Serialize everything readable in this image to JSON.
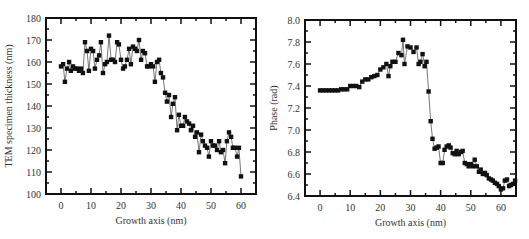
{
  "chart_data": [
    {
      "type": "line",
      "title": "",
      "xlabel": "Growth axis (nm)",
      "ylabel": "TEM specimen thickness (nm)",
      "xlim": [
        -5,
        65
      ],
      "ylim": [
        100,
        180
      ],
      "xticks": [
        0,
        10,
        20,
        30,
        40,
        50,
        60
      ],
      "yticks": [
        100,
        110,
        120,
        130,
        140,
        150,
        160,
        170,
        180
      ],
      "grid": false,
      "legend": null,
      "marker": "square",
      "series": [
        {
          "name": "thickness",
          "x": [
            0,
            0.7,
            1.3,
            2,
            2.7,
            3.3,
            4,
            4.7,
            5.3,
            6,
            6.7,
            7.3,
            8,
            8.7,
            9.3,
            10,
            10.7,
            11.3,
            12,
            12.7,
            13.3,
            14,
            14.7,
            15.3,
            16,
            16.7,
            17.3,
            18,
            18.7,
            19.3,
            20,
            20.7,
            21.3,
            22,
            22.7,
            23.3,
            24,
            24.7,
            25.3,
            26,
            26.7,
            27.3,
            28,
            28.7,
            29.3,
            30,
            30.7,
            31.3,
            32,
            32.7,
            33.3,
            34,
            34.7,
            35.3,
            36,
            36.7,
            37.3,
            38,
            38.7,
            39.3,
            40,
            40.7,
            41.3,
            42,
            42.7,
            43.3,
            44,
            44.7,
            45.3,
            46,
            46.7,
            47.3,
            48,
            48.7,
            49.3,
            50,
            50.7,
            51.3,
            52,
            52.7,
            53.3,
            54,
            54.7,
            55.3,
            56,
            56.7,
            57.3,
            58,
            58.7,
            59.3,
            60
          ],
          "values": [
            158,
            159,
            151,
            157,
            160,
            156,
            158,
            157,
            157,
            156,
            157,
            155,
            169,
            165,
            156,
            166,
            165,
            157,
            161,
            163,
            169,
            155,
            159,
            160,
            172,
            161,
            161,
            160,
            169,
            168,
            161,
            157,
            158,
            161,
            166,
            159,
            167,
            166,
            165,
            170,
            161,
            165,
            164,
            158,
            158,
            159,
            158,
            151,
            160,
            161,
            155,
            153,
            146,
            142,
            145,
            135,
            141,
            144,
            129,
            136,
            131,
            131,
            135,
            133,
            132,
            129,
            131,
            126,
            128,
            119,
            127,
            124,
            122,
            121,
            117,
            124,
            122,
            122,
            120,
            124,
            119,
            120,
            114,
            124,
            128,
            126,
            121,
            121,
            117,
            121,
            108,
            115,
            118,
            117,
            113,
            112
          ]
        }
      ]
    },
    {
      "type": "line",
      "title": "",
      "xlabel": "Growth axis (nm)",
      "ylabel": "Phase (rad)",
      "xlim": [
        -5,
        65
      ],
      "ylim": [
        6.4,
        8.0
      ],
      "xticks": [
        0,
        10,
        20,
        30,
        40,
        50,
        60
      ],
      "yticks": [
        6.4,
        6.6,
        6.8,
        7.0,
        7.2,
        7.4,
        7.6,
        7.8,
        8.0
      ],
      "grid": false,
      "legend": null,
      "marker": "square",
      "series": [
        {
          "name": "phase",
          "x": [
            0,
            1,
            2,
            3,
            4,
            5,
            6,
            7,
            8,
            9,
            10,
            11,
            12,
            13,
            14,
            15,
            16,
            17,
            18,
            19,
            20,
            21,
            22,
            22.7,
            23.3,
            24,
            25,
            26,
            27,
            27.5,
            28,
            29,
            30,
            31,
            32,
            32.7,
            33.3,
            34,
            34.7,
            35.3,
            36,
            36.7,
            37.3,
            38,
            38.7,
            39.3,
            40,
            40.7,
            41.3,
            42,
            42.7,
            43.3,
            44,
            44.7,
            45.3,
            46,
            46.7,
            47.3,
            48,
            48.7,
            49.3,
            50,
            50.7,
            51.3,
            52,
            52.7,
            53.3,
            54,
            54.7,
            55.3,
            56,
            56.7,
            57.3,
            58,
            58.7,
            59.3,
            60,
            60.7,
            61.3,
            62,
            62.7,
            63.3,
            64,
            64.7
          ],
          "values": [
            7.36,
            7.36,
            7.36,
            7.36,
            7.36,
            7.36,
            7.36,
            7.37,
            7.37,
            7.37,
            7.4,
            7.4,
            7.4,
            7.39,
            7.44,
            7.46,
            7.46,
            7.48,
            7.49,
            7.5,
            7.55,
            7.57,
            7.6,
            7.49,
            7.58,
            7.62,
            7.62,
            7.7,
            7.68,
            7.82,
            7.6,
            7.76,
            7.75,
            7.71,
            7.75,
            7.6,
            7.62,
            7.69,
            7.58,
            7.62,
            7.35,
            7.08,
            6.92,
            6.83,
            6.84,
            6.85,
            6.7,
            6.7,
            6.82,
            6.85,
            6.86,
            6.84,
            6.79,
            6.78,
            6.81,
            6.78,
            6.8,
            6.81,
            6.7,
            6.69,
            6.67,
            6.69,
            6.67,
            6.73,
            6.67,
            6.62,
            6.64,
            6.6,
            6.61,
            6.59,
            6.56,
            6.55,
            6.54,
            6.52,
            6.51,
            6.49,
            6.46,
            6.47,
            6.54,
            6.55,
            6.49,
            6.5,
            6.51,
            6.54
          ]
        }
      ]
    }
  ]
}
